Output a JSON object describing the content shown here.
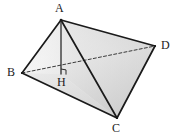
{
  "figure": {
    "background_color": "#ffffff",
    "stroke_color": "#1a1a1a",
    "fill_light": "#fbfbfb",
    "fill_mid": "#e4e4e4",
    "fill_dark": "#c9c9c9",
    "labels": {
      "A": "A",
      "B": "B",
      "C": "C",
      "D": "D",
      "H": "H"
    },
    "points": {
      "A": {
        "x": 61,
        "y": 20
      },
      "B": {
        "x": 22,
        "y": 73
      },
      "C": {
        "x": 117,
        "y": 118
      },
      "D": {
        "x": 155,
        "y": 46
      },
      "H": {
        "x": 61,
        "y": 74
      }
    },
    "edges": [
      {
        "name": "AB",
        "from": "A",
        "to": "B",
        "style": "solid"
      },
      {
        "name": "AC",
        "from": "A",
        "to": "C",
        "style": "solid"
      },
      {
        "name": "AD",
        "from": "A",
        "to": "D",
        "style": "solid"
      },
      {
        "name": "BC",
        "from": "B",
        "to": "C",
        "style": "solid"
      },
      {
        "name": "CD",
        "from": "C",
        "to": "D",
        "style": "solid"
      },
      {
        "name": "BD",
        "from": "B",
        "to": "D",
        "style": "dashed"
      },
      {
        "name": "AH",
        "from": "A",
        "to": "H",
        "style": "solid"
      }
    ],
    "right_angle": {
      "at": "H",
      "marker": "square",
      "size": 5
    }
  }
}
